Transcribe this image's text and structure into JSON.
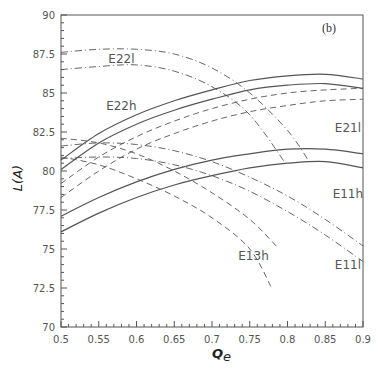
{
  "chart_data": {
    "type": "line",
    "title": "",
    "panel_label": "(b)",
    "xlabel": "Q_e",
    "ylabel": "L(A)",
    "xlim": [
      0.5,
      0.9
    ],
    "ylim": [
      70,
      90
    ],
    "grid": false,
    "legend": "inline curve labels",
    "x_ticks": [
      "0.5",
      "0.55",
      "0.6",
      "0.65",
      "0.7",
      "0.75",
      "0.8",
      "0.85",
      "0.9"
    ],
    "y_ticks": [
      "70",
      "72.5",
      "75",
      "77.5",
      "80",
      "82.5",
      "85",
      "87.5",
      "90"
    ],
    "series": [
      {
        "name": "E22h (upper)",
        "style": "solid",
        "x": [
          0.5,
          0.55,
          0.6,
          0.65,
          0.7,
          0.75,
          0.8,
          0.85,
          0.9
        ],
        "y": [
          80.7,
          82.4,
          83.6,
          84.5,
          85.2,
          85.8,
          86.1,
          86.2,
          85.9
        ]
      },
      {
        "name": "E22h (lower)",
        "style": "solid",
        "x": [
          0.5,
          0.55,
          0.6,
          0.65,
          0.7,
          0.75,
          0.8,
          0.85,
          0.9
        ],
        "y": [
          80.1,
          81.8,
          83.0,
          83.9,
          84.6,
          85.2,
          85.5,
          85.6,
          85.3
        ]
      },
      {
        "name": "E11h (upper)",
        "style": "solid",
        "x": [
          0.5,
          0.55,
          0.6,
          0.65,
          0.7,
          0.75,
          0.8,
          0.85,
          0.9
        ],
        "y": [
          77.1,
          78.3,
          79.3,
          80.1,
          80.7,
          81.1,
          81.4,
          81.4,
          81.1
        ]
      },
      {
        "name": "E11h (lower)",
        "style": "solid",
        "x": [
          0.5,
          0.55,
          0.6,
          0.65,
          0.7,
          0.75,
          0.8,
          0.85,
          0.9
        ],
        "y": [
          76.1,
          77.3,
          78.3,
          79.1,
          79.7,
          80.2,
          80.5,
          80.6,
          80.2
        ]
      },
      {
        "name": "E22l (upper)",
        "style": "dashdot",
        "x": [
          0.5,
          0.55,
          0.6,
          0.65,
          0.7,
          0.75,
          0.8,
          0.83
        ],
        "y": [
          87.6,
          87.8,
          87.8,
          87.5,
          86.6,
          85.0,
          82.6,
          80.5
        ]
      },
      {
        "name": "E22l (lower)",
        "style": "dashdot",
        "x": [
          0.5,
          0.55,
          0.6,
          0.65,
          0.7,
          0.75,
          0.8
        ],
        "y": [
          86.5,
          86.7,
          86.8,
          86.4,
          85.4,
          83.6,
          80.3
        ]
      },
      {
        "name": "E21l (upper)",
        "style": "dashed",
        "x": [
          0.5,
          0.55,
          0.6,
          0.65,
          0.7,
          0.75,
          0.8,
          0.85,
          0.9
        ],
        "y": [
          79.2,
          80.9,
          82.2,
          83.2,
          84.0,
          84.6,
          85.0,
          85.2,
          85.3
        ]
      },
      {
        "name": "E21l (lower)",
        "style": "dashed",
        "x": [
          0.5,
          0.55,
          0.6,
          0.65,
          0.7,
          0.75,
          0.8,
          0.85,
          0.9
        ],
        "y": [
          78.3,
          80.0,
          81.4,
          82.4,
          83.2,
          83.8,
          84.2,
          84.5,
          84.6
        ]
      },
      {
        "name": "E11l (upper)",
        "style": "dashdot",
        "x": [
          0.5,
          0.55,
          0.6,
          0.65,
          0.7,
          0.75,
          0.8,
          0.85,
          0.9
        ],
        "y": [
          81.6,
          81.8,
          81.7,
          81.3,
          80.6,
          79.6,
          78.4,
          76.9,
          75.2
        ]
      },
      {
        "name": "E11l (lower)",
        "style": "dashdot",
        "x": [
          0.5,
          0.55,
          0.6,
          0.65,
          0.7,
          0.75,
          0.8,
          0.85,
          0.9
        ],
        "y": [
          80.8,
          80.9,
          80.8,
          80.4,
          79.7,
          78.7,
          77.4,
          75.9,
          74.2
        ]
      },
      {
        "name": "E13h (upper)",
        "style": "dashed",
        "x": [
          0.5,
          0.55,
          0.6,
          0.65,
          0.7,
          0.75,
          0.785
        ],
        "y": [
          82.1,
          81.8,
          81.1,
          80.0,
          78.6,
          76.9,
          75.2
        ]
      },
      {
        "name": "E13h (lower)",
        "style": "dashed",
        "x": [
          0.5,
          0.55,
          0.6,
          0.65,
          0.7,
          0.75,
          0.78
        ],
        "y": [
          80.9,
          80.4,
          79.5,
          78.4,
          77.0,
          75.0,
          72.4
        ]
      }
    ],
    "annotations": [
      {
        "text": "E22l",
        "x": 0.58,
        "y": 86.9
      },
      {
        "text": "E22h",
        "x": 0.58,
        "y": 83.9
      },
      {
        "text": "E21l",
        "x": 0.88,
        "y": 82.5
      },
      {
        "text": "E11h",
        "x": 0.88,
        "y": 78.3
      },
      {
        "text": "E13h",
        "x": 0.755,
        "y": 74.3
      },
      {
        "text": "E11l",
        "x": 0.88,
        "y": 73.7
      }
    ]
  }
}
